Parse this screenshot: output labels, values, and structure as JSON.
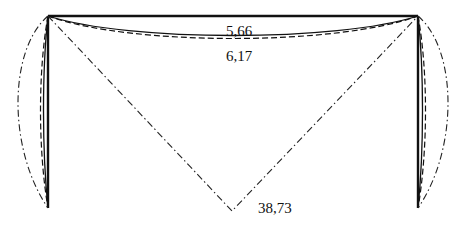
{
  "diagram": {
    "type": "portal-frame-deflection",
    "colors": {
      "line": "#111111",
      "background": "#ffffff"
    },
    "frame": {
      "top_left": [
        48,
        16
      ],
      "top_right": [
        418,
        16
      ],
      "bottom_left": [
        48,
        208
      ],
      "bottom_right": [
        418,
        208
      ]
    },
    "curves": [
      {
        "name": "solid-deflection",
        "style": "solid"
      },
      {
        "name": "dashed-deflection",
        "style": "dashed"
      },
      {
        "name": "dash-dot-deflection",
        "style": "dash-dot"
      }
    ],
    "labels": {
      "beam_solid_value": "5,66",
      "beam_dashed_value": "6,17",
      "peak_dashdot_value": "38,73"
    }
  }
}
